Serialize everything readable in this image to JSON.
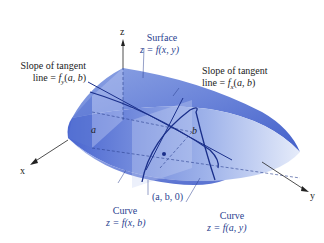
{
  "figure": {
    "type": "3d-surface-diagram",
    "colors": {
      "surface_light": "#d6e0f7",
      "surface_mid": "#7f98e0",
      "surface_dark": "#2f4fc4",
      "curve": "#1a2f8a",
      "axis": "#222222",
      "label_blue": "#2a3f8f",
      "label_black": "#222222"
    },
    "axes": {
      "x": "x",
      "y": "y",
      "z": "z"
    },
    "points": {
      "a": "a",
      "b": "b",
      "origin_point": "(a, b, 0)"
    },
    "labels": {
      "surface_title": "Surface",
      "surface_eq": "z = f(x, y)",
      "slope_fy_line1": "Slope of tangent",
      "slope_fy_line2": "line = f_y(a, b)",
      "slope_fx_line1": "Slope of tangent",
      "slope_fx_line2": "line = f_x(a, b)",
      "curve_xb_title": "Curve",
      "curve_xb_eq": "z = f(x, b)",
      "curve_ay_title": "Curve",
      "curve_ay_eq": "z = f(a, y)"
    }
  }
}
